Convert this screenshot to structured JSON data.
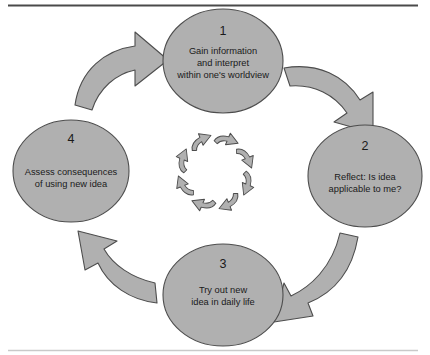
{
  "figure": {
    "kind": "cycle-diagram",
    "shape_fill": "#b0b0b0",
    "shape_stroke": "#4d4d4d",
    "text_color": "#1a1a1a",
    "background": "#ffffff",
    "frame": {
      "top_rule_color": "#4a4a4a",
      "bottom_rule_color": "#c9c9c9"
    }
  },
  "nodes": [
    {
      "number": "1",
      "lines": [
        "Gain information",
        "and interpret",
        "within one's worldview"
      ],
      "position": "top"
    },
    {
      "number": "2",
      "lines": [
        "Reflect: Is idea",
        "applicable to me?"
      ],
      "position": "right"
    },
    {
      "number": "3",
      "lines": [
        "Try out new",
        "idea in daily life"
      ],
      "position": "bottom"
    },
    {
      "number": "4",
      "lines": [
        "Assess consequences",
        "of using new idea"
      ],
      "position": "left"
    }
  ],
  "connectors": [
    {
      "name": "arrow-4-to-1",
      "from": "4",
      "to": "1",
      "direction": "clockwise"
    },
    {
      "name": "arrow-1-to-2",
      "from": "1",
      "to": "2",
      "direction": "clockwise"
    },
    {
      "name": "arrow-2-to-3",
      "from": "2",
      "to": "3",
      "direction": "clockwise"
    },
    {
      "name": "arrow-3-to-4",
      "from": "3",
      "to": "4",
      "direction": "clockwise"
    }
  ],
  "center_ring": {
    "name": "center-cycle-ring",
    "arrow_count": 8,
    "direction": "clockwise"
  }
}
